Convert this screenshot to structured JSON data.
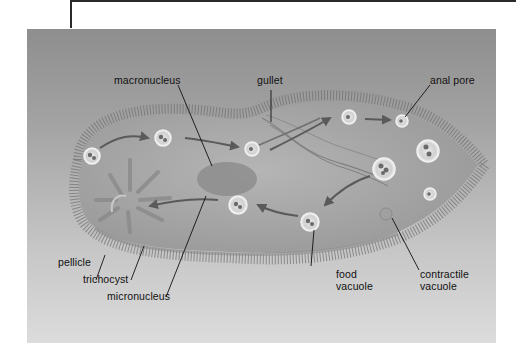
{
  "figure": {
    "labels": {
      "macronucleus": "macronucleus",
      "gullet": "gullet",
      "anal_pore": "anal pore",
      "pellicle": "pellicle",
      "trichocyst": "trichocyst",
      "micronucleus": "micronucleus",
      "food_vacuole_line1": "food",
      "food_vacuole_line2": "vacuole",
      "contractile_vacuole_line1": "contractile",
      "contractile_vacuole_line2": "vacuole"
    },
    "colors": {
      "background_top": "#8e8e8e",
      "background_bottom": "#dcdcdc",
      "cell_body": "#a9a9a9",
      "cilia": "#6e6e6e",
      "label_text": "#111111"
    }
  }
}
